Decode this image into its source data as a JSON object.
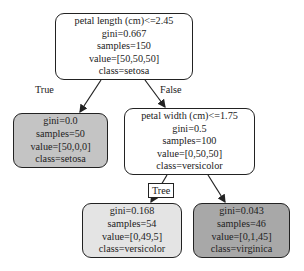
{
  "tree": {
    "nodes": [
      {
        "id": "root",
        "lines": [
          "petal length (cm)<=2.45",
          "gini=0.667",
          "samples=150",
          "value=[50,50,50]",
          "class=setosa"
        ],
        "fill": "#ffffff"
      },
      {
        "id": "left-leaf",
        "lines": [
          "gini=0.0",
          "samples=50",
          "value=[50,0,0]",
          "class=setosa"
        ],
        "fill": "#c4c4c4"
      },
      {
        "id": "right-split",
        "lines": [
          "petal width (cm)<=1.75",
          "gini=0.5",
          "samples=100",
          "value=[0,50,50]",
          "class=versicolor"
        ],
        "fill": "#ffffff"
      },
      {
        "id": "versicolor-leaf",
        "lines": [
          "gini=0.168",
          "samples=54",
          "value=[0,49,5]",
          "class=versicolor"
        ],
        "fill": "#e4e4e4"
      },
      {
        "id": "virginica-leaf",
        "lines": [
          "gini=0.043",
          "samples=46",
          "value=[0,1,45]",
          "class=virginica"
        ],
        "fill": "#a8a8a8"
      }
    ],
    "edge_labels": {
      "true": "True",
      "false": "False",
      "tree": "Tree"
    },
    "colors": {
      "stroke": "#222222"
    }
  }
}
